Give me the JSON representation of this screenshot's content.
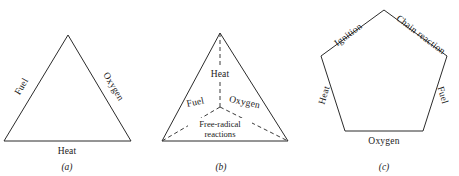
{
  "figure": {
    "background_color": "#ffffff",
    "line_color": "#2b2b2b",
    "text_color": "#1a1a1a",
    "panels": [
      {
        "id": "a",
        "caption": "(a)",
        "shape": "triangle",
        "labels": {
          "left_edge": "Fuel",
          "right_edge": "Oxygen",
          "bottom_edge": "Heat"
        }
      },
      {
        "id": "b",
        "caption": "(b)",
        "shape": "tetrahedron",
        "labels": {
          "top_center": "Heat",
          "left_inner": "Fuel",
          "right_inner": "Oxygen",
          "bottom_inner_line1": "Free-radical",
          "bottom_inner_line2": "reactions"
        }
      },
      {
        "id": "c",
        "caption": "(c)",
        "shape": "pentagon",
        "labels": {
          "upper_left_edge": "Ignition",
          "upper_right_edge": "Chain reaction",
          "left_edge": "Heat",
          "right_edge": "Fuel",
          "bottom_edge": "Oxygen"
        }
      }
    ]
  }
}
